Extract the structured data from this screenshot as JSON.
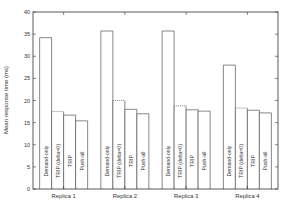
{
  "chart_data": {
    "type": "bar",
    "title": "",
    "xlabel": "",
    "ylabel": "Mean response time (ms)",
    "ylim": [
      0,
      40
    ],
    "yticks": [
      0,
      5,
      10,
      15,
      20,
      25,
      30,
      35,
      40
    ],
    "grid": false,
    "legend": "none (series labels written vertically inside bars)",
    "categories": [
      "Replica 1",
      "Replica 2",
      "Replica 3",
      "Replica 4"
    ],
    "series": [
      {
        "name": "Demand-only",
        "values": [
          34.2,
          35.7,
          35.7,
          28.0
        ],
        "style": "solid"
      },
      {
        "name": "TRIP (delta=0)",
        "values": [
          17.5,
          20.0,
          18.8,
          18.3
        ],
        "style": "dotted-top"
      },
      {
        "name": "TRIP",
        "values": [
          16.7,
          18.0,
          17.9,
          17.8
        ],
        "style": "solid"
      },
      {
        "name": "Push-all",
        "values": [
          15.4,
          17.0,
          17.6,
          17.2
        ],
        "style": "solid"
      }
    ]
  },
  "colors": {
    "axis": "#333333",
    "bar_stroke": "#555555",
    "bar_fill": "#ffffff",
    "text": "#333333"
  }
}
